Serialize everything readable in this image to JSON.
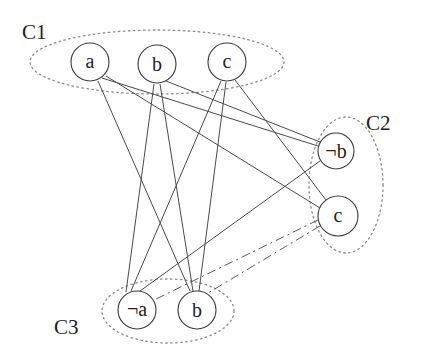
{
  "diagram": {
    "type": "graph",
    "clusters": [
      {
        "id": "C1",
        "label": "C1",
        "nodes": [
          "a",
          "b",
          "c"
        ]
      },
      {
        "id": "C2",
        "label": "C2",
        "nodes": [
          "not_b",
          "c2"
        ]
      },
      {
        "id": "C3",
        "label": "C3",
        "nodes": [
          "not_a",
          "b3"
        ]
      }
    ],
    "nodes": [
      {
        "id": "a",
        "label": "a",
        "cluster": "C1"
      },
      {
        "id": "b",
        "label": "b",
        "cluster": "C1"
      },
      {
        "id": "c",
        "label": "c",
        "cluster": "C1"
      },
      {
        "id": "not_b",
        "label": "¬b",
        "cluster": "C2"
      },
      {
        "id": "c2",
        "label": "c",
        "cluster": "C2"
      },
      {
        "id": "not_a",
        "label": "¬a",
        "cluster": "C3"
      },
      {
        "id": "b3",
        "label": "b",
        "cluster": "C3"
      }
    ],
    "edges": [
      {
        "from": "a",
        "to": "not_b"
      },
      {
        "from": "a",
        "to": "c2"
      },
      {
        "from": "a",
        "to": "b3"
      },
      {
        "from": "b",
        "to": "not_b"
      },
      {
        "from": "b",
        "to": "not_a"
      },
      {
        "from": "b",
        "to": "b3"
      },
      {
        "from": "c",
        "to": "not_a"
      },
      {
        "from": "c",
        "to": "b3"
      },
      {
        "from": "c",
        "to": "c2"
      },
      {
        "from": "not_b",
        "to": "not_a"
      },
      {
        "from": "c2",
        "to": "not_a",
        "style": "dashed"
      },
      {
        "from": "c2",
        "to": "b3",
        "style": "dashed"
      }
    ]
  }
}
